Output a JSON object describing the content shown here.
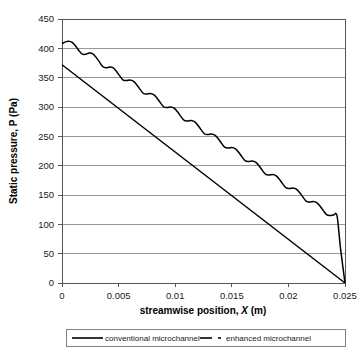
{
  "chart_data": {
    "type": "line",
    "title": "",
    "xlabel": "streamwise position, X (m)",
    "xlabel_parts": {
      "pre": "streamwise position, ",
      "italic": "X",
      "post": " (m)"
    },
    "ylabel": "Static pressure, P (Pa)",
    "xlim": [
      0,
      0.025
    ],
    "ylim": [
      0,
      450
    ],
    "xticks": [
      0,
      0.005,
      0.01,
      0.015,
      0.02,
      0.025
    ],
    "xtick_labels": [
      "0",
      "0.005",
      "0.01",
      "0.015",
      "0.02",
      "0.025"
    ],
    "yticks": [
      0,
      50,
      100,
      150,
      200,
      250,
      300,
      350,
      400,
      450
    ],
    "ytick_labels": [
      "0",
      "50",
      "100",
      "150",
      "200",
      "250",
      "300",
      "350",
      "400",
      "450"
    ],
    "grid": "horizontal",
    "legend_position": "below",
    "colors": {
      "line": "#000000",
      "grid": "#808080",
      "frame": "#555555"
    },
    "series": [
      {
        "name": "conventional microchannel",
        "style": "solid",
        "x": [
          0,
          0.025
        ],
        "values": [
          372,
          0
        ]
      },
      {
        "name": "enhanced microchannel",
        "style": "dash-dot",
        "comment": "monotonically decreasing sawtooth/scalloped profile: 14 oscillation cycles superposed on a linear decline from ~410 Pa at x=0 to 0 Pa at x=0.025",
        "x": [
          0.0,
          0.0003,
          0.0006,
          0.0009,
          0.0012,
          0.0015,
          0.0018,
          0.0021,
          0.0024,
          0.0027,
          0.003,
          0.0033,
          0.0036,
          0.0039,
          0.0042,
          0.0045,
          0.0048,
          0.0051,
          0.0054,
          0.0057,
          0.006,
          0.0063,
          0.0066,
          0.0069,
          0.0072,
          0.0075,
          0.0078,
          0.0081,
          0.0084,
          0.0087,
          0.009,
          0.0093,
          0.0096,
          0.0099,
          0.0102,
          0.0105,
          0.0108,
          0.0111,
          0.0114,
          0.0117,
          0.012,
          0.0123,
          0.0126,
          0.0129,
          0.0132,
          0.0135,
          0.0138,
          0.0141,
          0.0144,
          0.0147,
          0.015,
          0.0153,
          0.0156,
          0.0159,
          0.0162,
          0.0165,
          0.0168,
          0.0171,
          0.0174,
          0.0177,
          0.018,
          0.0183,
          0.0186,
          0.0189,
          0.0192,
          0.0195,
          0.0198,
          0.0201,
          0.0204,
          0.0207,
          0.021,
          0.0213,
          0.0216,
          0.0219,
          0.0222,
          0.0225,
          0.0228,
          0.0231,
          0.0234,
          0.0237,
          0.024,
          0.0243,
          0.0246,
          0.025
        ],
        "values": [
          408,
          411,
          412,
          410,
          404,
          396,
          390,
          390,
          392,
          391,
          385,
          377,
          369,
          367,
          368,
          367,
          361,
          353,
          346,
          345,
          346,
          344,
          338,
          330,
          323,
          322,
          323,
          321,
          315,
          307,
          300,
          299,
          300,
          298,
          292,
          284,
          277,
          276,
          277,
          275,
          269,
          261,
          254,
          253,
          254,
          252,
          246,
          238,
          231,
          230,
          231,
          229,
          223,
          215,
          208,
          207,
          208,
          206,
          200,
          192,
          185,
          184,
          185,
          183,
          177,
          169,
          162,
          161,
          162,
          160,
          154,
          146,
          139,
          138,
          139,
          137,
          131,
          123,
          116,
          115,
          116,
          114,
          60,
          0
        ],
        "start_value": 410,
        "end_value": 0,
        "n_cycles": 14
      }
    ]
  },
  "legend": {
    "items": [
      {
        "label": "conventional microchannel",
        "style": "solid"
      },
      {
        "label": "enhanced microchannel",
        "style": "dash-dot"
      }
    ]
  }
}
